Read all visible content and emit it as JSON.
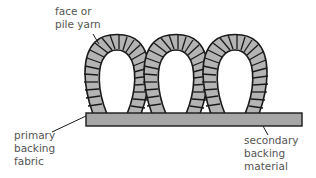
{
  "diagram": {
    "labels": {
      "pile_yarn": "face or\npile yarn",
      "primary_backing": "primary\nbacking\nfabric",
      "secondary_backing": "secondary\nbacking\nmaterial"
    },
    "colors": {
      "yarn_fill": "#b4b4b4",
      "backing_fill": "#a6a6a6",
      "outline": "#1a1a1a",
      "label_text": "#555555"
    },
    "loop_count": 3
  }
}
